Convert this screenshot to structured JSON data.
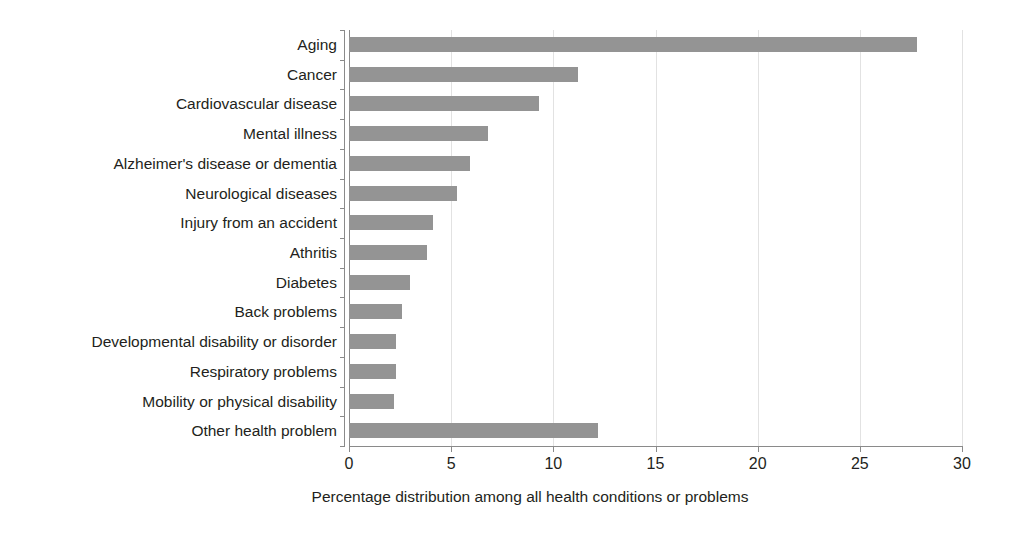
{
  "chart_data": {
    "type": "bar",
    "orientation": "horizontal",
    "title": "",
    "subtitle": "",
    "xlabel": "Percentage distribution among all health conditions or problems",
    "ylabel": "",
    "xlim": [
      0,
      30
    ],
    "xticks": [
      0,
      5,
      10,
      15,
      20,
      25,
      30
    ],
    "xtick_labels": [
      "0",
      "5",
      "10",
      "15",
      "20",
      "25",
      "30"
    ],
    "grid": true,
    "grid_axis": "x",
    "legend": false,
    "legend_position": "none",
    "bar_color": "#949494",
    "axis_color": "#8a8a8a",
    "gridline_color": "#e2e2e2",
    "text_color": "#231f20",
    "categories": [
      "Aging",
      "Cancer",
      "Cardiovascular disease",
      "Mental illness",
      "Alzheimer's disease or dementia",
      "Neurological diseases",
      "Injury from an accident",
      "Athritis",
      "Diabetes",
      "Back problems",
      "Developmental disability or disorder",
      "Respiratory problems",
      "Mobility or physical disability",
      "Other health problem"
    ],
    "values": [
      27.8,
      11.2,
      9.3,
      6.8,
      5.9,
      5.3,
      4.1,
      3.8,
      3.0,
      2.6,
      2.3,
      2.3,
      2.2,
      12.2
    ]
  }
}
